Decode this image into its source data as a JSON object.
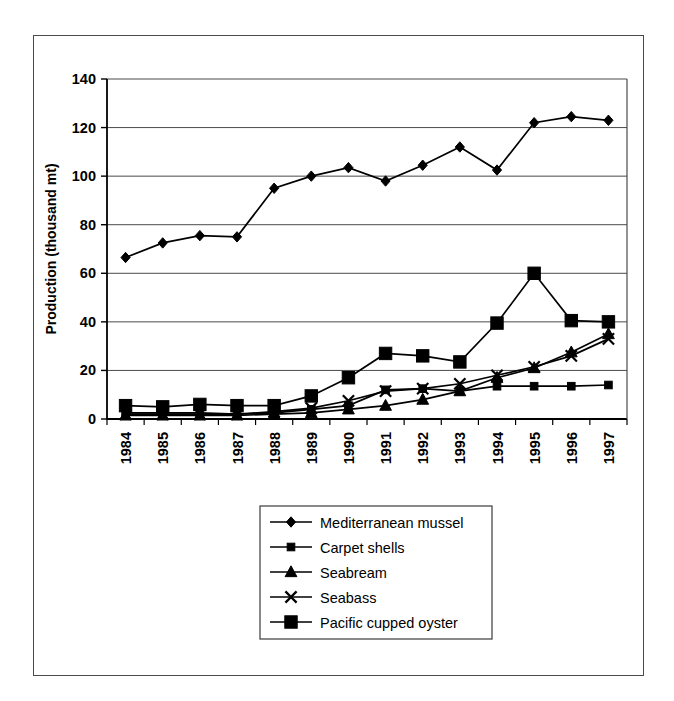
{
  "chart_data": {
    "type": "line",
    "title": "",
    "xlabel": "",
    "ylabel": "Production (thousand mt)",
    "categories": [
      "1984",
      "1985",
      "1986",
      "1987",
      "1988",
      "1989",
      "1990",
      "1991",
      "1992",
      "1993",
      "1994",
      "1995",
      "1996",
      "1997"
    ],
    "x": [
      1984,
      1985,
      1986,
      1987,
      1988,
      1989,
      1990,
      1991,
      1992,
      1993,
      1994,
      1995,
      1996,
      1997
    ],
    "ylim": [
      0,
      140
    ],
    "yticks": [
      0,
      20,
      40,
      60,
      80,
      100,
      120,
      140
    ],
    "grid": "horizontal",
    "legend_position": "bottom-center",
    "series": [
      {
        "name": "Mediterranean mussel",
        "marker": "diamond",
        "values": [
          66.5,
          72.5,
          75.5,
          75.0,
          95.0,
          100.0,
          103.5,
          98.0,
          104.5,
          112.0,
          102.5,
          122.0,
          124.5,
          123.0
        ]
      },
      {
        "name": "Carpet shells",
        "marker": "small-square",
        "values": [
          2.5,
          2.5,
          2.5,
          2.0,
          2.5,
          4.0,
          5.5,
          12.0,
          12.5,
          11.5,
          13.5,
          13.5,
          13.5,
          14.0
        ]
      },
      {
        "name": "Seabream",
        "marker": "triangle",
        "values": [
          1.5,
          1.5,
          1.5,
          1.5,
          2.0,
          2.5,
          4.0,
          5.5,
          8.0,
          11.5,
          17.0,
          21.0,
          27.5,
          35.0
        ]
      },
      {
        "name": "Seabass",
        "marker": "cross",
        "values": [
          2.0,
          2.0,
          2.0,
          2.0,
          3.0,
          4.5,
          7.5,
          11.5,
          12.5,
          14.5,
          18.0,
          21.5,
          26.0,
          33.0
        ]
      },
      {
        "name": "Pacific cupped oyster",
        "marker": "large-square",
        "values": [
          5.5,
          5.0,
          6.0,
          5.5,
          5.5,
          9.5,
          17.0,
          27.0,
          26.0,
          23.5,
          39.5,
          60.0,
          40.5,
          40.0
        ]
      }
    ]
  },
  "legend": {
    "entries": [
      {
        "label": "Mediterranean mussel",
        "marker": "diamond"
      },
      {
        "label": "Carpet shells",
        "marker": "small-square"
      },
      {
        "label": "Seabream",
        "marker": "triangle"
      },
      {
        "label": "Seabass",
        "marker": "cross"
      },
      {
        "label": "Pacific cupped oyster",
        "marker": "large-square"
      }
    ]
  },
  "colors": {
    "ink": "#000000",
    "gridline": "#4a4a4a",
    "frame": "#4a4a4a",
    "background": "#ffffff"
  }
}
